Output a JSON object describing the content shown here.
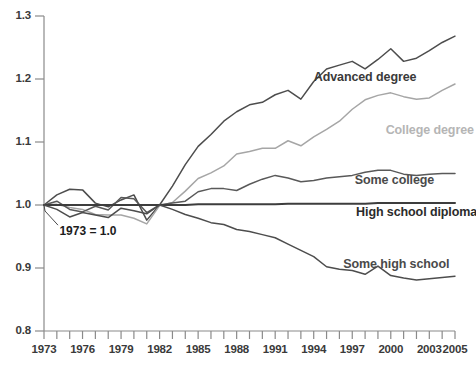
{
  "chart_data": {
    "type": "line",
    "title": "",
    "subtitle": "",
    "xlabel": "",
    "ylabel": "",
    "xlim": [
      1973,
      2005
    ],
    "ylim": [
      0.8,
      1.3
    ],
    "grid": false,
    "legend_position": "inline-right",
    "annotations": [
      {
        "text": "1973 = 1.0",
        "x": 1974.2,
        "y": 0.957
      }
    ],
    "y_ticks": [
      0.8,
      0.9,
      1.0,
      1.1,
      1.2,
      1.3
    ],
    "y_tick_labels": [
      "0.8",
      "0.9",
      "1.0",
      "1.1",
      "1.2",
      "1.3"
    ],
    "x_ticks": [
      1973,
      1974,
      1975,
      1976,
      1977,
      1978,
      1979,
      1980,
      1981,
      1982,
      1983,
      1984,
      1985,
      1986,
      1987,
      1988,
      1989,
      1990,
      1991,
      1992,
      1993,
      1994,
      1995,
      1996,
      1997,
      1998,
      1999,
      2000,
      2001,
      2002,
      2003,
      2004,
      2005
    ],
    "x_tick_labels": [
      "1973",
      "1976",
      "1979",
      "1982",
      "1985",
      "1988",
      "1991",
      "1994",
      "1997",
      "2000",
      "2003",
      "2005"
    ],
    "x_tick_label_years": [
      1973,
      1976,
      1979,
      1982,
      1985,
      1988,
      1991,
      1994,
      1997,
      2000,
      2003,
      2005
    ],
    "x": [
      1973,
      1974,
      1975,
      1976,
      1977,
      1978,
      1979,
      1980,
      1981,
      1982,
      1983,
      1984,
      1985,
      1986,
      1987,
      1988,
      1989,
      1990,
      1991,
      1992,
      1993,
      1994,
      1995,
      1996,
      1997,
      1998,
      1999,
      2000,
      2001,
      2002,
      2003,
      2004,
      2005
    ],
    "series": [
      {
        "name": "Advanced degree",
        "color": "#4d4d4d",
        "label_x": 1994.0,
        "label_y": 1.202,
        "label_color": "#3a3a3a",
        "values": [
          1.0,
          1.016,
          1.025,
          1.024,
          1.003,
          0.997,
          1.008,
          1.016,
          0.976,
          1.0,
          1.03,
          1.064,
          1.093,
          1.112,
          1.133,
          1.148,
          1.159,
          1.163,
          1.175,
          1.182,
          1.168,
          1.196,
          1.216,
          1.222,
          1.228,
          1.216,
          1.231,
          1.248,
          1.228,
          1.233,
          1.245,
          1.258,
          1.268
        ]
      },
      {
        "name": "College degree",
        "color": "#a6a6a6",
        "label_x": 1999.6,
        "label_y": 1.118,
        "label_color": "#b5b5b5",
        "values": [
          1.0,
          1.001,
          0.996,
          0.993,
          0.985,
          0.984,
          0.984,
          0.979,
          0.97,
          0.999,
          1.004,
          1.022,
          1.042,
          1.051,
          1.062,
          1.081,
          1.085,
          1.09,
          1.09,
          1.102,
          1.094,
          1.108,
          1.12,
          1.133,
          1.152,
          1.167,
          1.174,
          1.178,
          1.172,
          1.168,
          1.17,
          1.182,
          1.192
        ]
      },
      {
        "name": "Some college",
        "color": "#595959",
        "label_x": 1997.2,
        "label_y": 1.038,
        "label_color": "#4a4a4a",
        "values": [
          1.0,
          1.006,
          0.993,
          0.989,
          0.998,
          0.992,
          1.012,
          1.01,
          0.988,
          1.0,
          1.003,
          1.006,
          1.021,
          1.026,
          1.026,
          1.023,
          1.033,
          1.041,
          1.047,
          1.043,
          1.037,
          1.039,
          1.043,
          1.045,
          1.047,
          1.052,
          1.055,
          1.055,
          1.049,
          1.047,
          1.049,
          1.05,
          1.05
        ]
      },
      {
        "name": "High school diploma",
        "color": "#3d3d3d",
        "label_x": 1997.3,
        "label_y": 0.988,
        "label_color": "#2b2b2b",
        "values": [
          1.0,
          1.0,
          1.0,
          1.0,
          1.0,
          1.0,
          1.0,
          1.0,
          1.0,
          1.0,
          1.0,
          1.0,
          1.001,
          1.001,
          1.001,
          1.001,
          1.001,
          1.001,
          1.001,
          1.002,
          1.002,
          1.002,
          1.002,
          1.002,
          1.002,
          1.002,
          1.003,
          1.003,
          1.003,
          1.003,
          1.003,
          1.003,
          1.003
        ]
      },
      {
        "name": "Some high school",
        "color": "#4d4d4d",
        "label_x": 1996.3,
        "label_y": 0.905,
        "label_color": "#4a4a4a",
        "values": [
          1.0,
          0.993,
          0.981,
          0.988,
          0.984,
          0.98,
          0.995,
          0.991,
          0.986,
          1.0,
          0.993,
          0.985,
          0.979,
          0.972,
          0.969,
          0.961,
          0.958,
          0.953,
          0.948,
          0.938,
          0.928,
          0.918,
          0.902,
          0.898,
          0.896,
          0.89,
          0.903,
          0.888,
          0.884,
          0.881,
          0.883,
          0.885,
          0.887
        ]
      }
    ]
  }
}
